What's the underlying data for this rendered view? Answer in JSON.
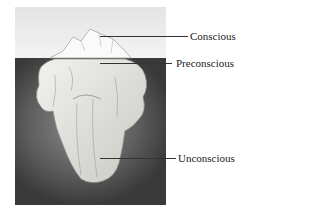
{
  "diagram": {
    "labels": [
      {
        "id": "conscious",
        "text": "Conscious"
      },
      {
        "id": "preconscious",
        "text": "Preconscious"
      },
      {
        "id": "unconscious",
        "text": "Unconscious"
      }
    ]
  }
}
